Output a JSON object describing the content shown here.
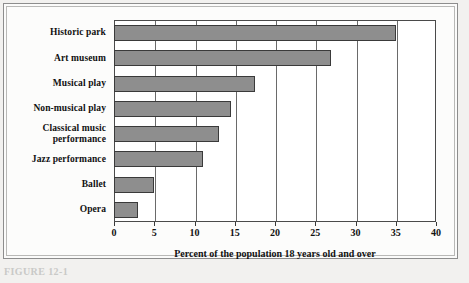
{
  "figure": {
    "caption": "FIGURE 12-1"
  },
  "chart_data": {
    "type": "bar",
    "orientation": "horizontal",
    "title": "",
    "subtitle": "",
    "xlabel": "Percent of the population 18 years old and over",
    "ylabel": "",
    "xlim": [
      0,
      40
    ],
    "xticks": [
      0,
      5,
      10,
      15,
      20,
      25,
      30,
      35,
      40
    ],
    "xtick_labels": [
      "0",
      "5",
      "10",
      "15",
      "20",
      "25",
      "30",
      "35",
      "40"
    ],
    "grid": true,
    "grid_axis": "x",
    "legend": false,
    "bar_color": "#8e8e8e",
    "bar_edge_color": "#3a3a3a",
    "categories": [
      "Historic park",
      "Art museum",
      "Musical play",
      "Non-musical play",
      "Classical music performance",
      "Jazz performance",
      "Ballet",
      "Opera"
    ],
    "values": [
      35,
      27,
      17.5,
      14.5,
      13,
      11,
      5,
      3
    ]
  }
}
